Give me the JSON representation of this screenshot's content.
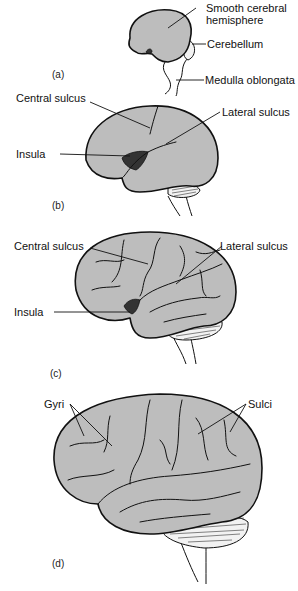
{
  "figure": {
    "fill_color": "#bdbdbd",
    "outline_color": "#111111",
    "panels": [
      {
        "id": "a",
        "label": "(a)",
        "annotations": [
          {
            "text_line1": "Smooth cerebral",
            "text_line2": "hemisphere"
          },
          {
            "text": "Cerebellum"
          },
          {
            "text": "Medulla oblongata"
          }
        ]
      },
      {
        "id": "b",
        "label": "(b)",
        "annotations": [
          {
            "text": "Central sulcus"
          },
          {
            "text": "Lateral sulcus"
          },
          {
            "text": "Insula"
          }
        ]
      },
      {
        "id": "c",
        "label": "(c)",
        "annotations": [
          {
            "text": "Central sulcus"
          },
          {
            "text": "Lateral sulcus"
          },
          {
            "text": "Insula"
          }
        ]
      },
      {
        "id": "d",
        "label": "(d)",
        "annotations": [
          {
            "text": "Gyri"
          },
          {
            "text": "Sulci"
          }
        ]
      }
    ]
  }
}
